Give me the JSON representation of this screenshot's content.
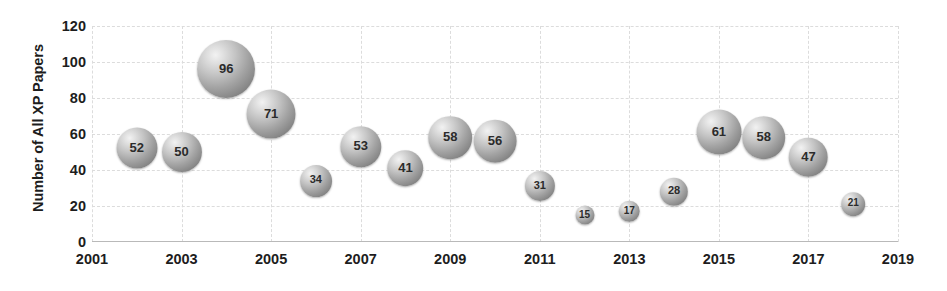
{
  "chart_data": {
    "type": "scatter",
    "title": "",
    "xlabel": "",
    "ylabel": "Number of All XP Papers",
    "xlim": [
      2001,
      2019
    ],
    "ylim": [
      0,
      120
    ],
    "grid": true,
    "legend": "none",
    "x_ticks": [
      "2001",
      "2003",
      "2005",
      "2007",
      "2009",
      "2011",
      "2013",
      "2015",
      "2017",
      "2019"
    ],
    "y_ticks": [
      "0",
      "20",
      "40",
      "60",
      "80",
      "100",
      "120"
    ],
    "x": [
      2002,
      2003,
      2004,
      2005,
      2006,
      2007,
      2008,
      2009,
      2010,
      2011,
      2012,
      2013,
      2014,
      2015,
      2016,
      2017,
      2018
    ],
    "values": [
      52,
      50,
      96,
      71,
      34,
      53,
      41,
      58,
      56,
      31,
      15,
      17,
      28,
      61,
      58,
      47,
      21
    ],
    "points": [
      {
        "x": 2002,
        "y": 52,
        "label": "52"
      },
      {
        "x": 2003,
        "y": 50,
        "label": "50"
      },
      {
        "x": 2004,
        "y": 96,
        "label": "96"
      },
      {
        "x": 2005,
        "y": 71,
        "label": "71"
      },
      {
        "x": 2006,
        "y": 34,
        "label": "34"
      },
      {
        "x": 2007,
        "y": 53,
        "label": "53"
      },
      {
        "x": 2008,
        "y": 41,
        "label": "41"
      },
      {
        "x": 2009,
        "y": 58,
        "label": "58"
      },
      {
        "x": 2010,
        "y": 56,
        "label": "56"
      },
      {
        "x": 2011,
        "y": 31,
        "label": "31"
      },
      {
        "x": 2012,
        "y": 15,
        "label": "15"
      },
      {
        "x": 2013,
        "y": 17,
        "label": "17"
      },
      {
        "x": 2014,
        "y": 28,
        "label": "28"
      },
      {
        "x": 2015,
        "y": 61,
        "label": "61"
      },
      {
        "x": 2016,
        "y": 58,
        "label": "58"
      },
      {
        "x": 2017,
        "y": 47,
        "label": "47"
      },
      {
        "x": 2018,
        "y": 21,
        "label": "21"
      }
    ],
    "colors": {
      "bubble_light": "#f2f2f2",
      "bubble_dark": "#6a6a6a",
      "label_text": "#2b2b2b",
      "axis_text": "#1d1d1d",
      "gridline": "#dcdcdc",
      "background": "#ffffff"
    }
  }
}
